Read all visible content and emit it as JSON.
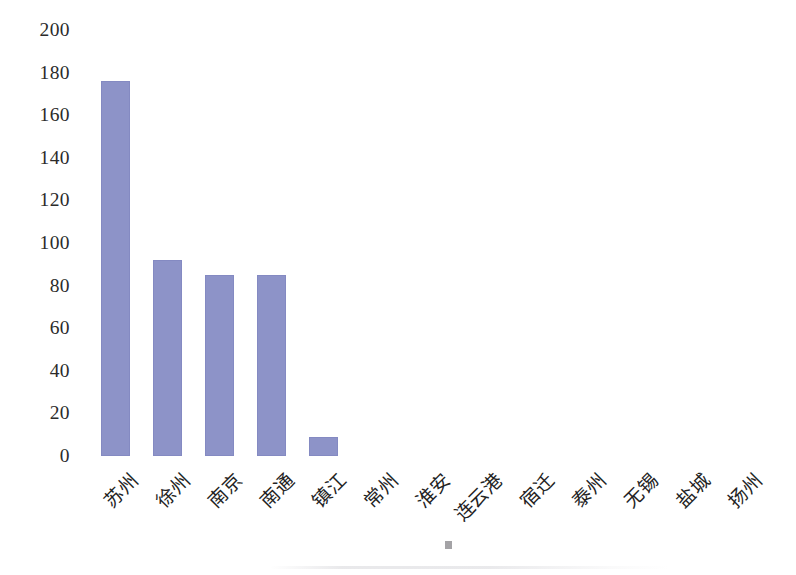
{
  "chart_data": {
    "type": "bar",
    "title": "",
    "subtitle": "",
    "xlabel": "",
    "ylabel": "",
    "categories": [
      "苏州",
      "徐州",
      "南京",
      "南通",
      "镇江",
      "常州",
      "淮安",
      "连云港",
      "宿迁",
      "泰州",
      "无锡",
      "盐城",
      "扬州"
    ],
    "values": [
      176,
      92,
      85,
      85,
      9,
      0,
      0,
      0,
      0,
      0,
      0,
      0,
      0
    ],
    "ylim": [
      0,
      200
    ],
    "ytick_values": [
      200,
      180,
      160,
      140,
      120,
      100,
      80,
      60,
      40,
      20,
      0
    ],
    "ytick_labels": [
      "200",
      "180",
      "160",
      "140",
      "120",
      "100",
      "80",
      "60",
      "40",
      "20",
      "0"
    ],
    "grid": false,
    "legend": false,
    "legend_position": "none",
    "series": [
      {
        "name": "",
        "values": [
          176,
          92,
          85,
          85,
          9,
          0,
          0,
          0,
          0,
          0,
          0,
          0,
          0
        ]
      }
    ],
    "colors": {
      "bar": "#8d93c8",
      "bar_edge": "#7e84be",
      "text": "#232323",
      "background": "#ffffff"
    },
    "xtick_rotation": -45
  }
}
